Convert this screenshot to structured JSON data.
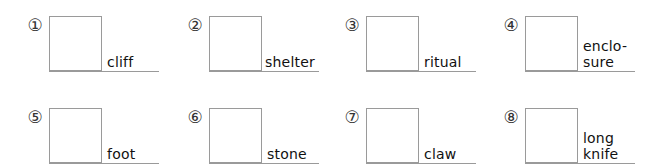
{
  "items": [
    {
      "number": "①",
      "word": "cliff"
    },
    {
      "number": "②",
      "word": "shelter"
    },
    {
      "number": "③",
      "word": "ritual"
    },
    {
      "number": "④",
      "word": "enclo-\nsure"
    },
    {
      "number": "⑤",
      "word": "foot"
    },
    {
      "number": "⑥",
      "word": "stone"
    },
    {
      "number": "⑦",
      "word": "claw"
    },
    {
      "number": "⑧",
      "word": "long\nknife"
    }
  ]
}
